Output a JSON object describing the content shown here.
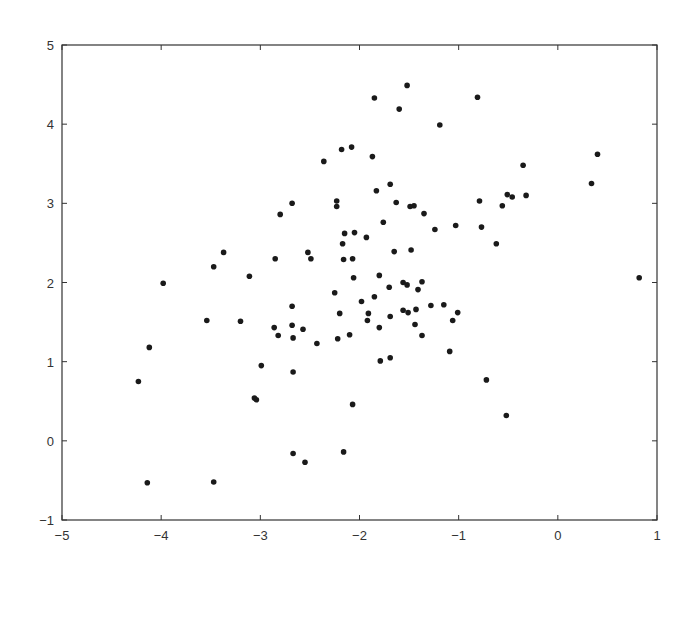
{
  "chart_data": {
    "type": "scatter",
    "title": "",
    "xlabel": "",
    "ylabel": "",
    "xlim": [
      -5,
      1
    ],
    "ylim": [
      -1,
      5
    ],
    "grid": false,
    "legend": null,
    "x_ticks": [
      "−5",
      "−4",
      "−3",
      "−2",
      "−1",
      "0",
      "1"
    ],
    "x_tick_values": [
      -5,
      -4,
      -3,
      -2,
      -1,
      0,
      1
    ],
    "y_ticks": [
      "−1",
      "0",
      "1",
      "2",
      "3",
      "4",
      "5"
    ],
    "y_tick_values": [
      -1,
      0,
      1,
      2,
      3,
      4,
      5
    ],
    "marker_color": "#1a1a1a",
    "series": [
      {
        "name": "points",
        "points": [
          [
            -1.52,
            4.49
          ],
          [
            -1.85,
            4.33
          ],
          [
            -0.81,
            4.34
          ],
          [
            -1.6,
            4.19
          ],
          [
            -1.19,
            3.99
          ],
          [
            -2.18,
            3.68
          ],
          [
            -2.08,
            3.71
          ],
          [
            -1.87,
            3.59
          ],
          [
            -2.36,
            3.53
          ],
          [
            0.4,
            3.62
          ],
          [
            -0.35,
            3.48
          ],
          [
            0.34,
            3.25
          ],
          [
            -1.83,
            3.16
          ],
          [
            -1.69,
            3.24
          ],
          [
            -0.51,
            3.11
          ],
          [
            -0.46,
            3.08
          ],
          [
            -0.32,
            3.1
          ],
          [
            -0.79,
            3.03
          ],
          [
            -0.56,
            2.97
          ],
          [
            -2.23,
            3.03
          ],
          [
            -2.23,
            2.96
          ],
          [
            -1.63,
            3.01
          ],
          [
            -1.49,
            2.96
          ],
          [
            -1.45,
            2.97
          ],
          [
            -2.68,
            3.0
          ],
          [
            -2.8,
            2.86
          ],
          [
            -1.35,
            2.87
          ],
          [
            -1.76,
            2.76
          ],
          [
            -1.24,
            2.67
          ],
          [
            -1.03,
            2.72
          ],
          [
            -0.77,
            2.7
          ],
          [
            -2.15,
            2.62
          ],
          [
            -2.05,
            2.63
          ],
          [
            -1.93,
            2.57
          ],
          [
            -2.17,
            2.49
          ],
          [
            -0.62,
            2.49
          ],
          [
            -1.65,
            2.39
          ],
          [
            -1.48,
            2.41
          ],
          [
            -3.37,
            2.38
          ],
          [
            -2.85,
            2.3
          ],
          [
            -2.52,
            2.38
          ],
          [
            -2.49,
            2.3
          ],
          [
            -2.16,
            2.29
          ],
          [
            -2.07,
            2.3
          ],
          [
            -3.47,
            2.2
          ],
          [
            -3.11,
            2.08
          ],
          [
            -2.06,
            2.06
          ],
          [
            -1.8,
            2.09
          ],
          [
            0.82,
            2.06
          ],
          [
            -3.98,
            1.99
          ],
          [
            -1.56,
            2.0
          ],
          [
            -1.52,
            1.97
          ],
          [
            -1.37,
            2.01
          ],
          [
            -1.7,
            1.94
          ],
          [
            -1.41,
            1.91
          ],
          [
            -2.25,
            1.87
          ],
          [
            -1.85,
            1.82
          ],
          [
            -1.98,
            1.76
          ],
          [
            -2.68,
            1.7
          ],
          [
            -1.28,
            1.71
          ],
          [
            -1.15,
            1.72
          ],
          [
            -1.43,
            1.66
          ],
          [
            -1.56,
            1.65
          ],
          [
            -1.51,
            1.62
          ],
          [
            -1.01,
            1.62
          ],
          [
            -2.2,
            1.61
          ],
          [
            -1.91,
            1.61
          ],
          [
            -1.69,
            1.57
          ],
          [
            -3.54,
            1.52
          ],
          [
            -3.2,
            1.51
          ],
          [
            -1.92,
            1.52
          ],
          [
            -1.06,
            1.52
          ],
          [
            -1.44,
            1.47
          ],
          [
            -2.86,
            1.43
          ],
          [
            -2.68,
            1.46
          ],
          [
            -2.57,
            1.41
          ],
          [
            -1.8,
            1.43
          ],
          [
            -2.82,
            1.33
          ],
          [
            -2.67,
            1.3
          ],
          [
            -1.37,
            1.33
          ],
          [
            -2.1,
            1.34
          ],
          [
            -2.22,
            1.29
          ],
          [
            -2.43,
            1.23
          ],
          [
            -4.12,
            1.18
          ],
          [
            -1.09,
            1.13
          ],
          [
            -1.69,
            1.05
          ],
          [
            -1.79,
            1.01
          ],
          [
            -2.99,
            0.95
          ],
          [
            -2.67,
            0.87
          ],
          [
            -0.72,
            0.77
          ],
          [
            -4.23,
            0.75
          ],
          [
            -3.06,
            0.54
          ],
          [
            -3.04,
            0.52
          ],
          [
            -2.07,
            0.46
          ],
          [
            -0.52,
            0.32
          ],
          [
            -2.67,
            -0.16
          ],
          [
            -2.16,
            -0.14
          ],
          [
            -2.55,
            -0.27
          ],
          [
            -4.14,
            -0.53
          ],
          [
            -3.47,
            -0.52
          ]
        ]
      }
    ]
  }
}
